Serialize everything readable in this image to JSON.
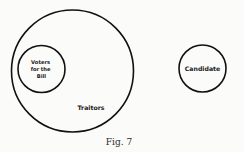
{
  "diagram": {
    "type": "euler-diagram",
    "caption": "Fig. 7",
    "sets": [
      {
        "id": "traitors",
        "label": "Traitors",
        "contains": [
          "voters_for_the_bill"
        ]
      },
      {
        "id": "voters_for_the_bill",
        "label_lines": [
          "Voters",
          "for the",
          "Bill"
        ],
        "inside": "traitors"
      },
      {
        "id": "candidate",
        "label": "Candidate",
        "disjoint_from": [
          "traitors"
        ]
      }
    ]
  },
  "colors": {
    "stroke": "#111111",
    "background": "#fbfbfa"
  }
}
